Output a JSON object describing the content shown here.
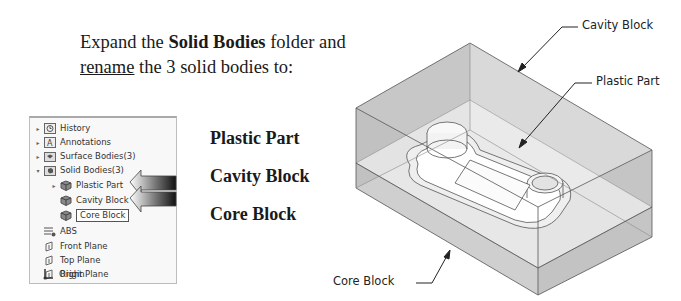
{
  "instructions": {
    "line1_pre": "Expand the ",
    "line1_bold": "Solid Bodies",
    "line1_post": " folder and",
    "line2_underlined": "rename",
    "line2_post": " the 3 solid bodies to:"
  },
  "tree": {
    "items": [
      {
        "label": "History",
        "icon": "history-icon",
        "caret": "▸"
      },
      {
        "label": "Annotations",
        "icon": "annotations-icon",
        "caret": "▸"
      },
      {
        "label": "Surface Bodies(3)",
        "icon": "surface-bodies-folder-icon",
        "caret": "▸"
      },
      {
        "label": "Solid Bodies(3)",
        "icon": "solid-bodies-folder-icon",
        "caret": "▾"
      },
      {
        "label": "Plastic Part",
        "icon": "solid-body-icon",
        "caret": "▸"
      },
      {
        "label": "Cavity Block",
        "icon": "solid-body-icon",
        "caret": ""
      },
      {
        "label": "Core Block",
        "icon": "solid-body-icon",
        "caret": "",
        "editing": true
      },
      {
        "label": "ABS",
        "icon": "material-icon",
        "caret": ""
      },
      {
        "label": "Front Plane",
        "icon": "plane-icon",
        "caret": ""
      },
      {
        "label": "Top Plane",
        "icon": "plane-icon",
        "caret": ""
      },
      {
        "label": "Right Plane",
        "icon": "plane-icon",
        "caret": ""
      },
      {
        "label": "Origin",
        "icon": "origin-icon",
        "caret": ""
      }
    ]
  },
  "new_names": [
    "Plastic Part",
    "Cavity Block",
    "Core Block"
  ],
  "callouts": {
    "cavity": "Cavity Block",
    "plastic": "Plastic Part",
    "core": "Core Block"
  },
  "colors": {
    "box_face_top": "#cfcfcf",
    "box_face_left": "#a9a9a9",
    "box_face_front": "#c4c4c4",
    "edge": "#555555"
  }
}
